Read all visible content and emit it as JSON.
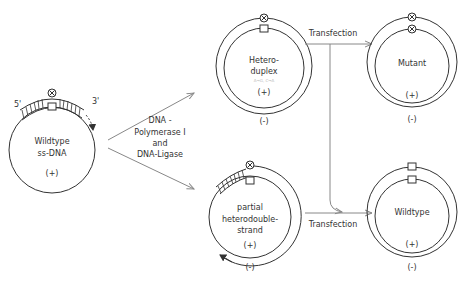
{
  "diagram": {
    "start": {
      "label_line1": "Wildtype",
      "label_line2": "ss-DNA",
      "strand": "(+)",
      "end5": "5'",
      "end3": "3'"
    },
    "enzyme": {
      "line1": "DNA -",
      "line2": "Polymerase I",
      "line3": "and",
      "line4": "DNA-Ligase"
    },
    "heteroduplex": {
      "line1": "Hetero-",
      "line2": "duplex",
      "faint": "A→G, C→A",
      "inner_strand": "(+)",
      "outer_strand": "(-)"
    },
    "partial": {
      "line1": "partial",
      "line2": "heterodouble-",
      "line3": "strand",
      "inner_strand": "(+)",
      "outer_strand": "(-)"
    },
    "transfection_top": "Transfection",
    "transfection_bottom": "Transfection",
    "mutant": {
      "label": "Mutant",
      "inner_strand": "(+)",
      "outer_strand": "(-)"
    },
    "wildtype": {
      "label": "Wildtype",
      "inner_strand": "(+)",
      "outer_strand": "(-)"
    },
    "icons": {
      "mutation_site": "circle-x-marker",
      "wildtype_site": "square-marker"
    },
    "colors": {
      "line": "#333333",
      "arrow": "#888888",
      "background": "#ffffff"
    }
  }
}
